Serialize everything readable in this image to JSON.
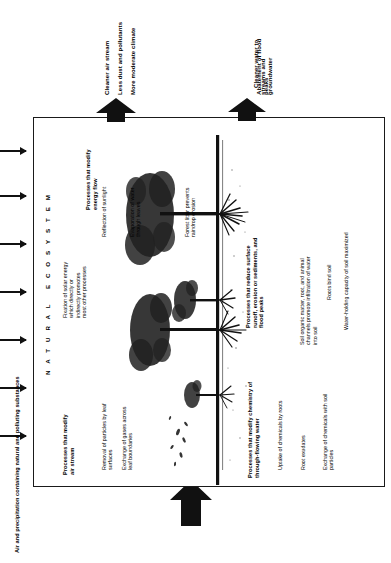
{
  "diagram": {
    "frame_label": "N A T U R A L   E C O S Y S T E M"
  },
  "inputs": {
    "label": "Air and precipitation containing natural and polluting substances",
    "arrow_count": 7,
    "arrow_icon": "arrow-right-icon"
  },
  "outputs": [
    {
      "id": "air-outputs",
      "arrow_icon": "block-arrow-up-icon",
      "items": [
        "Cleaner air stream",
        "Less dust and pollutants",
        "More moderate climate"
      ]
    },
    {
      "id": "water-outputs",
      "arrow_icon": "block-arrow-up-icon",
      "items": [
        "Cleaner water to streams and groundwater",
        "Abatement of flood peaks"
      ]
    }
  ],
  "process_groups": [
    {
      "id": "energy-flow",
      "heading": "Processes that modify energy flow",
      "items": [
        "Fixation of solar energy which directly or indirectly promotes most other processes",
        "Reflection of sunlight",
        "Evaporation of water through leaves"
      ]
    },
    {
      "id": "surface-runoff",
      "heading": "Processes that reduce surface runoff, erosion or sediments, and flood peaks",
      "items": [
        "Forest litter prevents raindrop erosion",
        "Soil organic matter, root, and animal channels promote infiltration of water into soil",
        "Roots bind soil",
        "Water-holding capacity of soil maximized"
      ]
    },
    {
      "id": "air-stream",
      "heading": "Processes that modify air stream",
      "items": [
        "Removal of particles by leaf surfaces",
        "Exchange of gases across leaf boundaries"
      ]
    },
    {
      "id": "water-chemistry",
      "heading": "Processes that modify chemistry of through-flowing water",
      "items": [
        "Uptake of chemicals by roots",
        "Root exudates",
        "Exchange of chemicals with soil particles"
      ]
    }
  ],
  "colors": {
    "ink": "#111111",
    "frame": "#1a1a1a",
    "background": "#ffffff"
  }
}
